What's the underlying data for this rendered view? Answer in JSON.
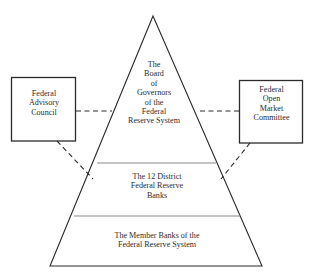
{
  "diagram": {
    "type": "pyramid-hierarchy",
    "background_color": "#ffffff",
    "line_color": "#2b2b2b",
    "divider_color": "#8a8a8a",
    "text_color": "#2b2b2b",
    "pyramid": {
      "tiers": [
        {
          "id": "board-of-governors",
          "level": 1,
          "label": "The\nBoard\nof\nGovernors\nof the\nFederal\nReserve System"
        },
        {
          "id": "district-reserve-banks",
          "level": 2,
          "label": "The 12 District\nFederal Reserve\nBanks"
        },
        {
          "id": "member-banks",
          "level": 3,
          "label": "The Member Banks of the\nFederal Reserve System"
        }
      ]
    },
    "side_boxes": [
      {
        "id": "federal-advisory-council",
        "side": "left",
        "label": "Federal\nAdvisory\nCouncil"
      },
      {
        "id": "federal-open-market-committee",
        "side": "right",
        "label": "Federal\nOpen\nMarket\nCommittee"
      }
    ],
    "connectors": [
      {
        "id": "fac-to-board",
        "style": "dashed",
        "from": "federal-advisory-council",
        "to": "board-of-governors"
      },
      {
        "id": "fac-to-district-banks",
        "style": "dashed",
        "from": "federal-advisory-council",
        "to": "district-reserve-banks"
      },
      {
        "id": "fomc-to-board",
        "style": "dashed",
        "from": "federal-open-market-committee",
        "to": "board-of-governors"
      },
      {
        "id": "fomc-to-district-banks",
        "style": "dashed",
        "from": "federal-open-market-committee",
        "to": "district-reserve-banks"
      }
    ]
  }
}
